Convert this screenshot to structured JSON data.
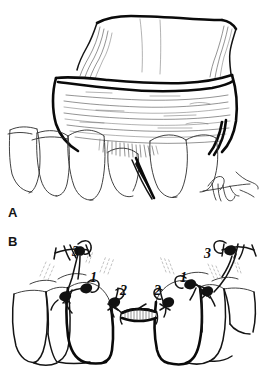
{
  "figure": {
    "background_color": "#ffffff",
    "ink_color": "#111111",
    "type": "line-drawing"
  },
  "panels": [
    {
      "id": "A",
      "label": "A",
      "caption": "Reflected full-thickness mucoperiosteal flap exposing edentulous ridge and adjacent teeth",
      "signature": "artist-signature"
    },
    {
      "id": "B",
      "label": "B",
      "caption": "Suture placement sequence across the surgical site",
      "signature": null
    }
  ],
  "annotations": [
    {
      "id": "b-left-3",
      "text": "3",
      "side": "left",
      "role": "vertical-releasing-incision-suture"
    },
    {
      "id": "b-left-1",
      "text": "1",
      "side": "left",
      "role": "papilla-suture"
    },
    {
      "id": "b-left-2",
      "text": "2",
      "side": "left",
      "role": "graft-margin-suture"
    },
    {
      "id": "b-right-2",
      "text": "2",
      "side": "right",
      "role": "graft-margin-suture"
    },
    {
      "id": "b-right-1",
      "text": "1",
      "side": "right",
      "role": "papilla-suture"
    },
    {
      "id": "b-right-3",
      "text": "3",
      "side": "right",
      "role": "vertical-releasing-incision-suture"
    }
  ],
  "suture_order": [
    "1",
    "2",
    "3"
  ],
  "elements": {
    "flap": "reflected-tissue-flap",
    "ridge": "alveolar-ridge",
    "graft": "connective-tissue-graft",
    "teeth_panel_a": 5,
    "teeth_panel_b": 6
  }
}
